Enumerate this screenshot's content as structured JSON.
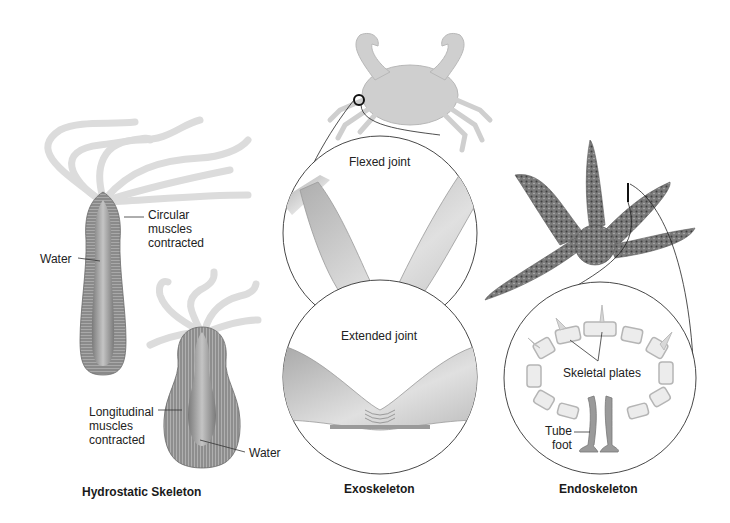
{
  "diagram": {
    "panels": [
      {
        "id": "hydrostatic",
        "caption": "Hydrostatic Skeleton",
        "labels": {
          "circular_muscles": "Circular\nmuscles\ncontracted",
          "water_top": "Water",
          "longitudinal_muscles": "Longitudinal\nmuscles\ncontracted",
          "water_bottom": "Water"
        }
      },
      {
        "id": "exoskeleton",
        "caption": "Exoskeleton",
        "labels": {
          "flexed": "Flexed joint",
          "extended": "Extended joint"
        }
      },
      {
        "id": "endoskeleton",
        "caption": "Endoskeleton",
        "labels": {
          "plates": "Skeletal plates",
          "tube_foot": "Tube\nfoot"
        }
      }
    ],
    "colors": {
      "body_gray": "#8c8c8c",
      "tentacle_gray": "#d9d9d9",
      "callout_line": "#333333",
      "starfish": "#6e6e6e"
    }
  }
}
